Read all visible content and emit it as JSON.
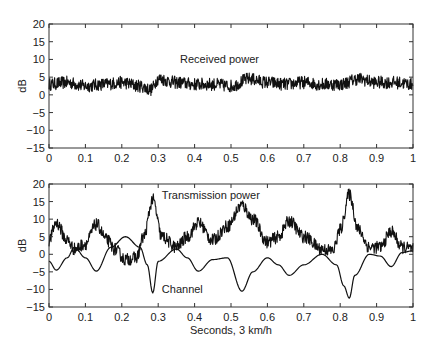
{
  "chart_data": [
    {
      "type": "line",
      "panel": "top",
      "title": "",
      "xlabel": "",
      "ylabel": "dB",
      "xlim": [
        0,
        1
      ],
      "ylim": [
        -15,
        20
      ],
      "xticks": [
        "0",
        "0.1",
        "0.2",
        "0.3",
        "0.4",
        "0.5",
        "0.6",
        "0.7",
        "0.8",
        "0.9",
        "1"
      ],
      "yticks": [
        "20",
        "15",
        "10",
        "5",
        "0",
        "−5",
        "−10",
        "−15"
      ],
      "grid": false,
      "annotations": [
        {
          "text": "Received power",
          "x": 0.36,
          "y": 10
        }
      ],
      "series": [
        {
          "name": "Received power",
          "style": "noisy",
          "x": [
            0,
            0.05,
            0.1,
            0.15,
            0.2,
            0.25,
            0.28,
            0.3,
            0.35,
            0.4,
            0.45,
            0.5,
            0.55,
            0.6,
            0.65,
            0.7,
            0.75,
            0.8,
            0.85,
            0.9,
            0.95,
            1.0
          ],
          "values": [
            3,
            3.5,
            2.5,
            3,
            3.5,
            2.5,
            1.5,
            4.5,
            3.5,
            3,
            3,
            2.5,
            4.5,
            3.5,
            3,
            3.5,
            3,
            3,
            4.5,
            3.5,
            3.5,
            3
          ],
          "noise_amplitude": 1.8
        }
      ]
    },
    {
      "type": "line",
      "panel": "bottom",
      "title": "",
      "xlabel": "Seconds, 3 km/h",
      "ylabel": "dB",
      "xlim": [
        0,
        1
      ],
      "ylim": [
        -15,
        20
      ],
      "xticks": [
        "0",
        "0.1",
        "0.2",
        "0.3",
        "0.4",
        "0.5",
        "0.6",
        "0.7",
        "0.8",
        "0.9",
        "1"
      ],
      "yticks": [
        "20",
        "15",
        "10",
        "5",
        "0",
        "−5",
        "−10",
        "−15"
      ],
      "grid": false,
      "annotations": [
        {
          "text": "Transmission power",
          "x": 0.31,
          "y": 17
        },
        {
          "text": "Channel",
          "x": 0.31,
          "y": -10
        }
      ],
      "series": [
        {
          "name": "Transmission power",
          "style": "noisy",
          "x": [
            0,
            0.02,
            0.05,
            0.07,
            0.1,
            0.13,
            0.16,
            0.18,
            0.21,
            0.24,
            0.26,
            0.285,
            0.31,
            0.35,
            0.38,
            0.41,
            0.45,
            0.49,
            0.53,
            0.56,
            0.6,
            0.63,
            0.66,
            0.7,
            0.75,
            0.78,
            0.8,
            0.825,
            0.85,
            0.88,
            0.91,
            0.94,
            0.97,
            1.0
          ],
          "values": [
            4,
            9,
            4,
            1.5,
            3,
            8.5,
            4,
            1.5,
            -1.5,
            -1,
            5,
            15.5,
            5,
            2,
            5,
            9,
            4,
            8,
            14,
            10,
            3.5,
            5,
            9.5,
            5,
            1.5,
            1,
            7,
            17,
            7,
            2,
            2,
            6.5,
            2,
            1.5
          ],
          "noise_amplitude": 1.8
        },
        {
          "name": "Channel",
          "style": "smooth",
          "x": [
            0,
            0.02,
            0.05,
            0.07,
            0.1,
            0.13,
            0.17,
            0.21,
            0.25,
            0.27,
            0.285,
            0.3,
            0.35,
            0.38,
            0.41,
            0.45,
            0.49,
            0.53,
            0.56,
            0.6,
            0.63,
            0.66,
            0.7,
            0.75,
            0.79,
            0.81,
            0.825,
            0.84,
            0.88,
            0.91,
            0.94,
            0.97,
            1.0
          ],
          "values": [
            -2,
            -4.5,
            -1,
            2,
            -1,
            -4.8,
            2,
            5,
            2,
            -3,
            -11,
            -2,
            1.5,
            -1,
            -4.8,
            -1.5,
            -1,
            -10.5,
            -5,
            -1,
            -3,
            -6,
            -3,
            0,
            -3,
            -9,
            -12.5,
            -6,
            0,
            -0.5,
            -3.5,
            0.5,
            1
          ]
        }
      ]
    }
  ]
}
